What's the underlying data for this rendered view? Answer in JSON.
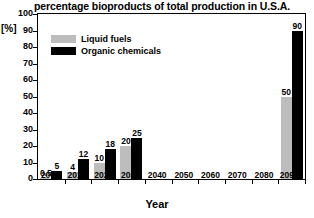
{
  "chart_data": {
    "type": "bar",
    "title": "percentage bioproducts of total production in U.S.A.",
    "xlabel": "Year",
    "ylabel": "[%]",
    "ylim": [
      0,
      100
    ],
    "ytick_step": 10,
    "grid": false,
    "legend_position": "top-left",
    "categories": [
      "2000",
      "2010",
      "2020",
      "2030",
      "2040",
      "2050",
      "2060",
      "2070",
      "2080",
      "2090*"
    ],
    "ytick_labels": [
      "0",
      "10",
      "20",
      "30",
      "40",
      "50",
      "60",
      "70",
      "80",
      "90",
      "100"
    ],
    "series": [
      {
        "name": "Liquid fuels",
        "color": "#bdbdbd",
        "values": [
          0.5,
          4,
          10,
          20,
          null,
          null,
          null,
          null,
          null,
          50
        ],
        "labels": [
          "0.5",
          "4",
          "10",
          "20",
          "",
          "",
          "",
          "",
          "",
          "50"
        ]
      },
      {
        "name": "Organic chemicals",
        "color": "#000000",
        "values": [
          5,
          12,
          18,
          25,
          null,
          null,
          null,
          null,
          null,
          90
        ],
        "labels": [
          "5",
          "12",
          "18",
          "25",
          "",
          "",
          "",
          "",
          "",
          "90"
        ]
      }
    ]
  }
}
